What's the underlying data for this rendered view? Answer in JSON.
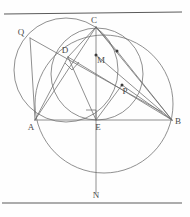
{
  "figure": {
    "background_color": "#fefefe",
    "stroke_color": "#6b6b6b",
    "label_color": "#4a4a4a",
    "rule_color": "#5a5a5a",
    "width": 190,
    "height": 217
  },
  "rules": [
    {
      "name": "top-rule",
      "x1": 4,
      "y1": 14,
      "x2": 182,
      "y2": 12
    },
    {
      "name": "bottom-rule",
      "x1": 2,
      "y1": 203,
      "x2": 182,
      "y2": 203
    }
  ],
  "circles": [
    {
      "name": "left-circle",
      "cx": 66,
      "cy": 70,
      "r": 52,
      "through": "Q, C, A"
    },
    {
      "name": "middle-circle",
      "cx": 97,
      "cy": 74,
      "r": 46,
      "through": "D, M, P, E"
    },
    {
      "name": "bottom-right-circle",
      "cx": 104,
      "cy": 104,
      "r": 69,
      "through": "A, B, N, C"
    }
  ],
  "points": [
    {
      "id": "Q",
      "label": "Q",
      "x": 30,
      "y": 38,
      "label_dx": -9,
      "label_dy": -3,
      "dot": false
    },
    {
      "id": "C",
      "label": "C",
      "x": 96,
      "y": 27,
      "label_dx": -2,
      "label_dy": -4,
      "dot": false
    },
    {
      "id": "D",
      "label": "D",
      "x": 68,
      "y": 57,
      "label_dx": -3,
      "label_dy": -4,
      "dot": false
    },
    {
      "id": "M",
      "label": "M",
      "x": 96,
      "y": 55,
      "label_dx": 3,
      "label_dy": 8,
      "dot": true
    },
    {
      "id": "X",
      "label": "",
      "x": 117,
      "y": 51,
      "label_dx": 0,
      "label_dy": 0,
      "dot": true
    },
    {
      "id": "P",
      "label": "P",
      "x": 122,
      "y": 85,
      "label_dx": 2,
      "label_dy": 9,
      "dot": true
    },
    {
      "id": "A",
      "label": "A",
      "x": 35,
      "y": 120,
      "label_dx": -4,
      "label_dy": 10,
      "dot": false
    },
    {
      "id": "E",
      "label": "E",
      "x": 96,
      "y": 120,
      "label_dx": 1,
      "label_dy": 10,
      "dot": false
    },
    {
      "id": "B",
      "label": "B",
      "x": 172,
      "y": 120,
      "label_dx": 4,
      "label_dy": 4,
      "dot": false
    },
    {
      "id": "N",
      "label": "N",
      "x": 96,
      "y": 188,
      "label_dx": 0,
      "label_dy": 10,
      "dot": false
    }
  ],
  "segments": [
    {
      "name": "segment-A-B",
      "x1": 35,
      "y1": 120,
      "x2": 172,
      "y2": 120
    },
    {
      "name": "segment-C-N",
      "x1": 96,
      "y1": 27,
      "x2": 96,
      "y2": 193
    },
    {
      "name": "segment-Q-P",
      "x1": 30,
      "y1": 38,
      "x2": 162,
      "y2": 112
    },
    {
      "name": "segment-C-A",
      "x1": 96,
      "y1": 27,
      "x2": 35,
      "y2": 120
    },
    {
      "name": "segment-C-B",
      "x1": 96,
      "y1": 27,
      "x2": 172,
      "y2": 120
    },
    {
      "name": "segment-C-D",
      "x1": 96,
      "y1": 27,
      "x2": 68,
      "y2": 57
    },
    {
      "name": "segment-C-X",
      "x1": 96,
      "y1": 27,
      "x2": 117,
      "y2": 51
    },
    {
      "name": "segment-D-B",
      "x1": 68,
      "y1": 57,
      "x2": 172,
      "y2": 120
    },
    {
      "name": "segment-D-A",
      "x1": 68,
      "y1": 57,
      "x2": 35,
      "y2": 120
    },
    {
      "name": "segment-D-E",
      "x1": 68,
      "y1": 57,
      "x2": 96,
      "y2": 120
    },
    {
      "name": "segment-M-B",
      "x1": 96,
      "y1": 55,
      "x2": 172,
      "y2": 120
    },
    {
      "name": "segment-X-B",
      "x1": 117,
      "y1": 51,
      "x2": 172,
      "y2": 120
    },
    {
      "name": "segment-P-B",
      "x1": 122,
      "y1": 85,
      "x2": 172,
      "y2": 120
    },
    {
      "name": "segment-E-P",
      "x1": 96,
      "y1": 120,
      "x2": 122,
      "y2": 85
    },
    {
      "name": "segment-Q-A",
      "x1": 30,
      "y1": 38,
      "x2": 35,
      "y2": 120
    }
  ],
  "right_angles": [
    {
      "name": "right-angle-at-D",
      "path": "M 66 64 L 73 70 L 79 63",
      "note": "perpendicular mark below D"
    },
    {
      "name": "right-angle-at-E",
      "path": "M 86 110 L 96 110 L 96 120",
      "note": "perpendicular mark above-left of E"
    }
  ]
}
